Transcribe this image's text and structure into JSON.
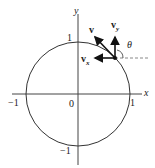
{
  "diagram": {
    "axes": {
      "x_label": "x",
      "y_label": "y"
    },
    "ticks": {
      "x_neg": "−1",
      "x_pos": "1",
      "origin": "0",
      "y_pos": "1",
      "y_neg": "−1"
    },
    "vectors": {
      "v": "v",
      "vy": "v",
      "vy_sub": "y",
      "vx": "v",
      "vx_sub": "x"
    },
    "angle": "θ"
  }
}
